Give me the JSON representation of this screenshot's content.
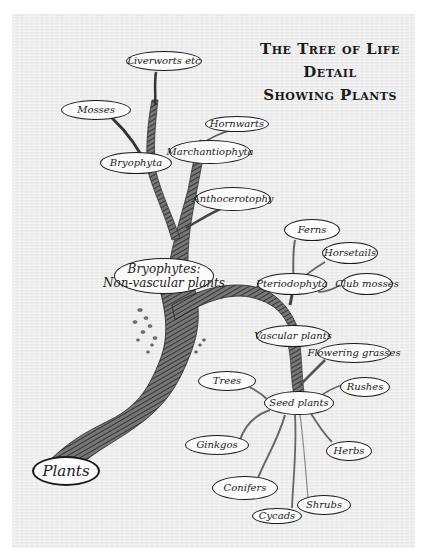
{
  "title": {
    "line1": "The Tree of Life",
    "line2": "Detail",
    "line3": "Showing Plants"
  },
  "nodes": {
    "plants": "Plants",
    "bryophytes": {
      "line1": "Bryophytes:",
      "line2": "Non-vascular plants"
    },
    "bryophyta": "Bryophyta",
    "mosses": "Mosses",
    "liverworts": "Liverworts etc",
    "hornwarts": "Hornwarts",
    "marchantiophyta": "Marchantiophyta",
    "anthocerotophy": "Anthocerotophy",
    "ferns": "Ferns",
    "horsetails": "Horsetails",
    "pteridophyta": "Pteriodophyta",
    "club_mosses": "Club mosses",
    "vascular_plants": "Vascular plants",
    "flowering_grasses": "Flowering grasses",
    "rushes": "Rushes",
    "trees": "Trees",
    "seed_plants": "Seed plants",
    "ginkgos": "Ginkgos",
    "herbs": "Herbs",
    "conifers": "Conifers",
    "shrubs": "Shrubs",
    "cycads": "Cycads"
  },
  "colors": {
    "ink": "#1a1a1a",
    "paper": "#ededed",
    "bark": "#4a4a4a"
  }
}
